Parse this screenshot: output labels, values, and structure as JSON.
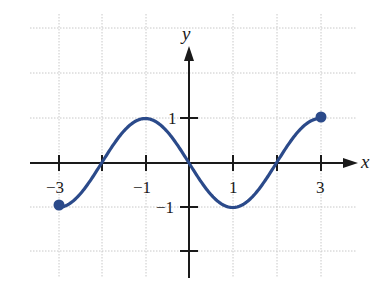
{
  "chart_data": {
    "type": "line",
    "title": "",
    "xlabel": "x",
    "ylabel": "y",
    "xlim": [
      -3,
      3
    ],
    "ylim": [
      -2,
      3
    ],
    "grid": true,
    "x_tick_labels": [
      "−3",
      "−1",
      "1",
      "3"
    ],
    "x_tick_values": [
      -3,
      -2,
      -1,
      0,
      1,
      2,
      3
    ],
    "y_tick_labels": [
      "1",
      "−1"
    ],
    "y_tick_values": [
      -2,
      -1,
      1
    ],
    "series": [
      {
        "name": "f(x)",
        "function": "y = -sin(pi*x/2)",
        "color": "#2b4a8a",
        "x": [
          -3,
          -2.5,
          -2,
          -1.5,
          -1,
          -0.5,
          0,
          0.5,
          1,
          1.5,
          2,
          2.5,
          3
        ],
        "y": [
          -1,
          -0.71,
          0,
          0.71,
          1,
          0.71,
          0,
          -0.71,
          -1,
          -0.71,
          0,
          0.71,
          1
        ],
        "endpoints": [
          {
            "x": -3,
            "y": -1,
            "closed": true
          },
          {
            "x": 3,
            "y": 1,
            "closed": true
          }
        ]
      }
    ]
  },
  "labels": {
    "x_axis": "x",
    "y_axis": "y",
    "xt_m3": "−3",
    "xt_m1": "−1",
    "xt_1": "1",
    "xt_3": "3",
    "yt_1": "1",
    "yt_m1": "−1"
  },
  "colors": {
    "curve": "#2b4a8a",
    "axis": "#1a1a1a",
    "grid": "#c8c8c8"
  }
}
